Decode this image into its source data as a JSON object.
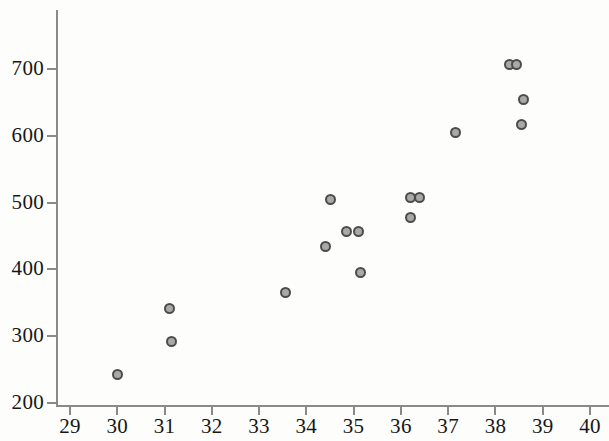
{
  "chart_data": {
    "type": "scatter",
    "title": "",
    "xlabel": "",
    "ylabel": "",
    "xlim": [
      29,
      40
    ],
    "ylim": [
      200,
      760
    ],
    "grid": false,
    "legend": null,
    "x_ticks": [
      29,
      30,
      31,
      32,
      33,
      34,
      35,
      36,
      37,
      38,
      39,
      40
    ],
    "x_tick_labels": [
      "29",
      "30",
      "31",
      "32",
      "33",
      "34",
      "35",
      "36",
      "37",
      "38",
      "39",
      "40"
    ],
    "y_ticks": [
      200,
      300,
      400,
      500,
      600,
      700
    ],
    "y_tick_labels": [
      "200",
      "300",
      "400",
      "500",
      "600",
      "700"
    ],
    "marker": {
      "shape": "circle",
      "fill_color": "#a9a9a9",
      "edge_color": "#4c4c4c",
      "size_px": 11
    },
    "axis_color": "#8a8a8a",
    "series": [
      {
        "name": "observations",
        "points": [
          {
            "x": 30.0,
            "y": 242
          },
          {
            "x": 31.1,
            "y": 342
          },
          {
            "x": 31.15,
            "y": 292
          },
          {
            "x": 33.55,
            "y": 366
          },
          {
            "x": 34.4,
            "y": 434
          },
          {
            "x": 34.5,
            "y": 504
          },
          {
            "x": 34.85,
            "y": 457
          },
          {
            "x": 35.1,
            "y": 457
          },
          {
            "x": 35.15,
            "y": 395
          },
          {
            "x": 36.2,
            "y": 478
          },
          {
            "x": 36.2,
            "y": 507
          },
          {
            "x": 36.4,
            "y": 507
          },
          {
            "x": 37.15,
            "y": 605
          },
          {
            "x": 38.3,
            "y": 707
          },
          {
            "x": 38.45,
            "y": 707
          },
          {
            "x": 38.55,
            "y": 617
          },
          {
            "x": 38.6,
            "y": 654
          }
        ]
      }
    ]
  },
  "geometry": {
    "x_axis_px": {
      "value_min": 29,
      "px_min": 70,
      "value_max": 40,
      "px_max": 590
    },
    "y_axis_px": {
      "value_min": 200,
      "px_min": 403,
      "value_max": 700,
      "px_max": 69
    }
  }
}
